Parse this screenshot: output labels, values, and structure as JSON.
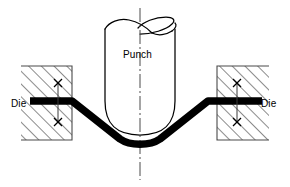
{
  "figure": {
    "background_color": "#ffffff",
    "line_color": "#000000",
    "workpiece_color": "#000000",
    "width": 290,
    "height": 187
  },
  "labels": {
    "punch": "Punch",
    "die_left": "Die",
    "die_right": "Die"
  },
  "icons": {
    "centerline": "centerline-dash-dot-icon",
    "hatch": "section-hatching-icon",
    "dimension_tick": "dimension-x-tick-icon"
  },
  "components": {
    "punch": {
      "name": "Punch",
      "shape": "cylinder-with-rounded-nose",
      "top_y": 18,
      "bottom_y": 135,
      "left_x": 104,
      "right_x": 176
    },
    "die_left": {
      "name": "Die",
      "shape": "hatched-rectangle",
      "x": 21,
      "y": 66,
      "width": 51,
      "height": 74
    },
    "die_right": {
      "name": "Die",
      "shape": "hatched-rectangle",
      "x": 217,
      "y": 66,
      "width": 52,
      "height": 74
    },
    "workpiece": {
      "name": "Sheet metal blank",
      "shape": "v-bent-strip",
      "thickness": 7
    },
    "centerline": {
      "name": "Vertical centerline",
      "x": 140,
      "y_top": 8,
      "y_bottom": 180,
      "style": "dash-dot"
    },
    "dimension_left": {
      "name": "Left die gap dimension",
      "x": 58,
      "y_top": 83,
      "y_bottom": 122
    },
    "dimension_right": {
      "name": "Right die gap dimension",
      "x": 237,
      "y_top": 83,
      "y_bottom": 122
    }
  }
}
